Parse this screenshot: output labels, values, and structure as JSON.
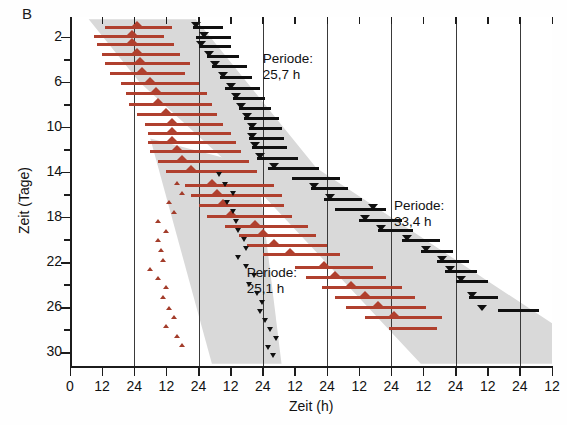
{
  "panel": {
    "letter": "B"
  },
  "axes": {
    "y_title": "Zeit (Tage)",
    "x_title": "Zeit (h)",
    "y_major_labels": [
      "2",
      "6",
      "10",
      "14",
      "18",
      "22",
      "26",
      "30"
    ],
    "y_major_values": [
      2,
      6,
      10,
      14,
      18,
      22,
      26,
      30
    ],
    "y_minor_values": [
      4,
      8,
      12,
      16,
      20,
      24,
      28
    ],
    "y_range": [
      0.2,
      31.2
    ],
    "x_labels": [
      "0",
      "12",
      "24",
      "12",
      "24",
      "12",
      "24",
      "12",
      "24",
      "12",
      "24",
      "12",
      "24",
      "12",
      "24",
      "12"
    ],
    "x_tick_hours": [
      0,
      12,
      24,
      36,
      48,
      60,
      72,
      84,
      96,
      108,
      120,
      132,
      144,
      156,
      168,
      180
    ],
    "x_gridline_hours": [
      24,
      48,
      72,
      96,
      120,
      144,
      168
    ],
    "x_range": [
      0,
      180
    ]
  },
  "annotations": [
    {
      "name": "periode-25-7",
      "line1": "Periode:",
      "line2": "25,7 h",
      "x_hour": 72,
      "y_day": 3.2
    },
    {
      "name": "periode-25-1",
      "line1": "Periode:",
      "line2": "25,1 h",
      "x_hour": 66,
      "y_day": 22.2
    },
    {
      "name": "periode-33-4",
      "line1": "Periode:",
      "line2": "33,4 h",
      "x_hour": 121,
      "y_day": 16.3
    }
  ],
  "colors": {
    "activity_red": "#b0402e",
    "temperature_black": "#101010",
    "confidence_band": "#d9d9d9",
    "axis": "#1c1c1c",
    "background": "#ffffff"
  },
  "chart_data": {
    "type": "bar",
    "title": "",
    "subtitle": "",
    "xlabel": "Zeit (h)",
    "ylabel": "Zeit (Tage)",
    "xlim": [
      0,
      180
    ],
    "ylim": [
      0.2,
      31.2
    ],
    "grid": true,
    "legend_position": "none",
    "series": [
      {
        "name": "Aktivitaet (rot)",
        "marker": "up-triangle",
        "color": "#b0402e",
        "bars": [
          {
            "day": 1.0,
            "start": 13,
            "end": 38,
            "tri": 25
          },
          {
            "day": 1.8,
            "start": 9,
            "end": 35,
            "tri": 23
          },
          {
            "day": 2.5,
            "start": 10,
            "end": 39,
            "tri": 23
          },
          {
            "day": 3.4,
            "start": 12,
            "end": 41,
            "tri": 25
          },
          {
            "day": 4.2,
            "start": 13,
            "end": 45,
            "tri": 26
          },
          {
            "day": 5.1,
            "start": 15,
            "end": 43,
            "tri": 27
          },
          {
            "day": 6.0,
            "start": 19,
            "end": 48,
            "tri": 30
          },
          {
            "day": 6.9,
            "start": 21,
            "end": 51,
            "tri": 32
          },
          {
            "day": 7.8,
            "start": 22,
            "end": 53,
            "tri": 33
          },
          {
            "day": 8.7,
            "start": 25,
            "end": 55,
            "tri": 36
          },
          {
            "day": 9.6,
            "start": 28,
            "end": 57,
            "tri": 38
          },
          {
            "day": 10.4,
            "start": 29,
            "end": 60,
            "tri": 38
          },
          {
            "day": 11.2,
            "start": 29,
            "end": 62,
            "tri": 38
          },
          {
            "day": 12.0,
            "start": 30,
            "end": 64,
            "tri": 40
          },
          {
            "day": 12.9,
            "start": 33,
            "end": 67,
            "tri": 42
          },
          {
            "day": 13.8,
            "start": 36,
            "end": 70,
            "tri": 45
          },
          {
            "day": 15.0,
            "start": 43,
            "end": 76,
            "tri": 53
          },
          {
            "day": 15.9,
            "start": 45,
            "end": 79,
            "tri": 55
          },
          {
            "day": 16.8,
            "start": 48,
            "end": 80,
            "tri": 57
          },
          {
            "day": 17.8,
            "start": 51,
            "end": 83,
            "tri": 60
          },
          {
            "day": 18.7,
            "start": 58,
            "end": 89,
            "tri": 69
          },
          {
            "day": 19.5,
            "start": 63,
            "end": 92,
            "tri": 72
          },
          {
            "day": 20.4,
            "start": 66,
            "end": 96,
            "tri": 76
          },
          {
            "day": 21.2,
            "start": 72,
            "end": 101,
            "tri": 82
          },
          {
            "day": 22.3,
            "start": 84,
            "end": 113,
            "tri": 95
          },
          {
            "day": 23.2,
            "start": 88,
            "end": 118,
            "tri": 99
          },
          {
            "day": 24.1,
            "start": 94,
            "end": 124,
            "tri": 105
          },
          {
            "day": 25.0,
            "start": 99,
            "end": 129,
            "tri": 110
          },
          {
            "day": 25.9,
            "start": 103,
            "end": 133,
            "tri": 115
          },
          {
            "day": 26.8,
            "start": 110,
            "end": 139,
            "tri": 121
          },
          {
            "day": 27.7,
            "start": 119,
            "end": 137,
            "tri": 0
          }
        ],
        "small_triangles": [
          {
            "day": 15.0,
            "x": 40
          },
          {
            "day": 15.9,
            "x": 42
          },
          {
            "day": 16.7,
            "x": 37
          },
          {
            "day": 17.6,
            "x": 39
          },
          {
            "day": 18.4,
            "x": 33
          },
          {
            "day": 19.3,
            "x": 36
          },
          {
            "day": 20.1,
            "x": 33
          },
          {
            "day": 21.0,
            "x": 34
          },
          {
            "day": 21.9,
            "x": 35
          },
          {
            "day": 22.7,
            "x": 30
          },
          {
            "day": 23.5,
            "x": 33
          },
          {
            "day": 24.3,
            "x": 36
          },
          {
            "day": 25.2,
            "x": 35
          },
          {
            "day": 26.1,
            "x": 37
          },
          {
            "day": 26.9,
            "x": 39
          },
          {
            "day": 27.7,
            "x": 36
          },
          {
            "day": 28.6,
            "x": 40
          },
          {
            "day": 29.4,
            "x": 42
          }
        ]
      },
      {
        "name": "Temperatur (schwarz)",
        "marker": "down-triangle",
        "color": "#101010",
        "bars": [
          {
            "day": 1.0,
            "start": 46,
            "end": 57,
            "tri": 47
          },
          {
            "day": 1.9,
            "start": 47,
            "end": 60,
            "tri": 50
          },
          {
            "day": 2.7,
            "start": 48,
            "end": 60,
            "tri": 49
          },
          {
            "day": 3.6,
            "start": 51,
            "end": 63,
            "tri": 52
          },
          {
            "day": 4.5,
            "start": 53,
            "end": 66,
            "tri": 54
          },
          {
            "day": 5.4,
            "start": 56,
            "end": 68,
            "tri": 57
          },
          {
            "day": 6.4,
            "start": 58,
            "end": 71,
            "tri": 60
          },
          {
            "day": 7.3,
            "start": 61,
            "end": 73,
            "tri": 62
          },
          {
            "day": 8.2,
            "start": 63,
            "end": 75,
            "tri": 64
          },
          {
            "day": 9.1,
            "start": 65,
            "end": 78,
            "tri": 66
          },
          {
            "day": 10.0,
            "start": 67,
            "end": 79,
            "tri": 68
          },
          {
            "day": 10.9,
            "start": 67,
            "end": 80,
            "tri": 68
          },
          {
            "day": 11.7,
            "start": 68,
            "end": 81,
            "tri": 69
          },
          {
            "day": 12.6,
            "start": 70,
            "end": 85,
            "tri": 71
          },
          {
            "day": 13.5,
            "start": 74,
            "end": 93,
            "tri": 76
          },
          {
            "day": 14.4,
            "start": 83,
            "end": 101,
            "tri": 0
          },
          {
            "day": 15.3,
            "start": 90,
            "end": 104,
            "tri": 91
          },
          {
            "day": 16.3,
            "start": 95,
            "end": 109,
            "tri": 97
          },
          {
            "day": 17.2,
            "start": 99,
            "end": 118,
            "tri": 113
          },
          {
            "day": 18.1,
            "start": 108,
            "end": 124,
            "tri": 110
          },
          {
            "day": 19.0,
            "start": 115,
            "end": 128,
            "tri": 116
          },
          {
            "day": 19.9,
            "start": 124,
            "end": 138,
            "tri": 126
          },
          {
            "day": 20.9,
            "start": 131,
            "end": 143,
            "tri": 133
          },
          {
            "day": 21.8,
            "start": 137,
            "end": 149,
            "tri": 139
          },
          {
            "day": 22.7,
            "start": 140,
            "end": 152,
            "tri": 142
          },
          {
            "day": 23.6,
            "start": 144,
            "end": 156,
            "tri": 146
          },
          {
            "day": 25.0,
            "start": 149,
            "end": 160,
            "tri": 150
          },
          {
            "day": 26.1,
            "start": 160,
            "end": 175,
            "tri": 154
          }
        ],
        "small_triangles": [
          {
            "day": 14.2,
            "x": 56
          },
          {
            "day": 15.1,
            "x": 58
          },
          {
            "day": 15.9,
            "x": 61
          },
          {
            "day": 16.7,
            "x": 59
          },
          {
            "day": 17.5,
            "x": 61
          },
          {
            "day": 18.4,
            "x": 62
          },
          {
            "day": 19.2,
            "x": 63
          },
          {
            "day": 20.0,
            "x": 65
          },
          {
            "day": 20.8,
            "x": 66
          },
          {
            "day": 21.6,
            "x": 63
          },
          {
            "day": 22.4,
            "x": 66
          },
          {
            "day": 23.2,
            "x": 69
          },
          {
            "day": 24.0,
            "x": 67
          },
          {
            "day": 24.8,
            "x": 70
          },
          {
            "day": 25.6,
            "x": 72
          },
          {
            "day": 26.4,
            "x": 71
          },
          {
            "day": 27.2,
            "x": 73
          },
          {
            "day": 28.0,
            "x": 75
          },
          {
            "day": 28.8,
            "x": 77
          },
          {
            "day": 29.6,
            "x": 74
          },
          {
            "day": 30.3,
            "x": 76
          }
        ]
      }
    ],
    "confidence_bands": [
      {
        "name": "band-upper-branch",
        "points_hours_days": [
          [
            7,
            0.4
          ],
          [
            47,
            0.4
          ],
          [
            92,
            13.6
          ],
          [
            185,
            28.2
          ],
          [
            185,
            31.0
          ],
          [
            131,
            31.0
          ],
          [
            72,
            16.0
          ],
          [
            26,
            6.0
          ],
          [
            7,
            0.4
          ]
        ]
      },
      {
        "name": "band-lower-branch",
        "points_hours_days": [
          [
            30,
            11.0
          ],
          [
            70,
            13.5
          ],
          [
            79,
            31.0
          ],
          [
            53,
            31.0
          ],
          [
            30,
            11.0
          ]
        ]
      }
    ]
  }
}
